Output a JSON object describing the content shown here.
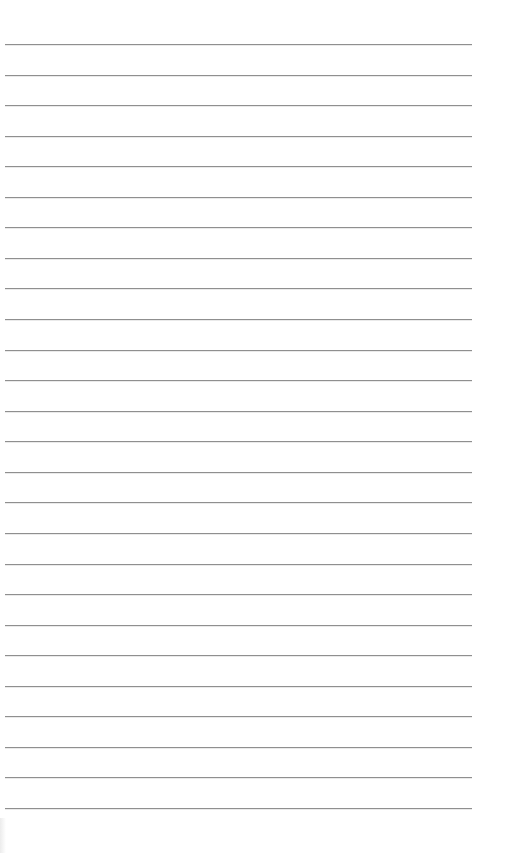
{
  "page": {
    "type": "lined-paper",
    "background_color": "#ffffff",
    "line_color": "#8f8f8f",
    "line_count": 26,
    "first_line_y": 44,
    "line_spacing_px": 30.56,
    "line_left_x": 5,
    "line_right_x": 472
  }
}
